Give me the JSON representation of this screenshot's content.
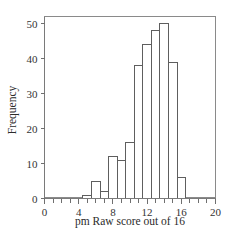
{
  "chart_data": {
    "type": "bar",
    "title": "",
    "subtitle": "",
    "xlabel": "pm Raw score out of 16",
    "ylabel": "Frequency",
    "xlim": [
      0,
      20
    ],
    "ylim": [
      0,
      52
    ],
    "grid": false,
    "legend": null,
    "bin_width": 1,
    "bin_starts": [
      4.5,
      5.5,
      6.5,
      7.5,
      8.5,
      9.5,
      10.5,
      11.5,
      12.5,
      13.5,
      14.5,
      15.5
    ],
    "categories": [
      "5",
      "6",
      "7",
      "8",
      "9",
      "10",
      "11",
      "12",
      "13",
      "14",
      "15",
      "16"
    ],
    "values": [
      1,
      5,
      2,
      12,
      11,
      16,
      38,
      44,
      48,
      50,
      39,
      6
    ],
    "x_ticks_major": [
      0,
      4,
      8,
      12,
      16,
      20
    ],
    "x_tick_labels": [
      "0",
      "4",
      "8",
      "12",
      "16",
      "20"
    ],
    "x_ticks_minor_step": 1,
    "y_ticks_major": [
      0,
      10,
      20,
      30,
      40,
      50
    ],
    "y_tick_labels": [
      "0",
      "10",
      "20",
      "30",
      "40",
      "50"
    ],
    "colors": {
      "bar_fill": "#ffffff",
      "bar_stroke": "#5e5e5e",
      "axis": "#7a7a7a",
      "text": "#2b2b2b",
      "background": "#ffffff"
    }
  }
}
